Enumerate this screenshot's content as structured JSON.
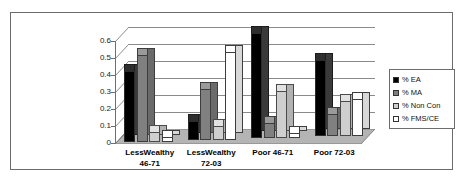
{
  "chart_data": {
    "type": "bar",
    "title": "",
    "subtitle": "",
    "xlabel": "",
    "ylabel": "Percent of Total Flows",
    "ylabel_lines": [
      "Percent of Total",
      "Flows"
    ],
    "categories": [
      "LessWealthy 46-71",
      "LessWealthy 72-03",
      "Poor 46-71",
      "Poor 72-03"
    ],
    "category_lines": [
      [
        "LessWealthy",
        "46-71"
      ],
      [
        "LessWealthy",
        "72-03"
      ],
      [
        "Poor 46-71",
        ""
      ],
      [
        "Poor 72-03",
        ""
      ]
    ],
    "series": [
      {
        "name": "% EA",
        "color": "#000000",
        "values": [
          0.42,
          0.11,
          0.62,
          0.45
        ]
      },
      {
        "name": "% MA",
        "color": "#808080",
        "values": [
          0.51,
          0.3,
          0.09,
          0.13
        ]
      },
      {
        "name": "% Non Con",
        "color": "#cfcfcf",
        "values": [
          0.06,
          0.085,
          0.28,
          0.21
        ]
      },
      {
        "name": "% FMS/CE",
        "color": "#ffffff",
        "values": [
          0.03,
          0.52,
          0.03,
          0.22
        ]
      }
    ],
    "ylim": [
      0,
      0.6
    ],
    "ytick_labels": [
      "0.6",
      "0.5",
      "0.4",
      "0.3",
      "0.2",
      "0.1",
      "0"
    ],
    "ytick_values": [
      0.6,
      0.5,
      0.4,
      0.3,
      0.2,
      0.1,
      0
    ],
    "grid": true,
    "legend_position": "right",
    "style": "3d-column",
    "colors": {
      "frame_border": "#6b6b6b",
      "gridline": "#8a8a8a",
      "axis": "#6f6f6f",
      "floor_front": "#8f8f8f",
      "floor_top": "#b4b4b4",
      "legend_border": "#6d6d6d",
      "background": "#ffffff"
    }
  }
}
